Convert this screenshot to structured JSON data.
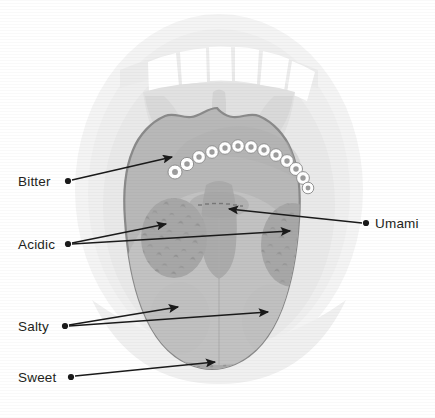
{
  "figure": {
    "background_color": "#ffffff"
  },
  "colors": {
    "page_background": "#ffffff",
    "lip_outer": "#f2f2f2",
    "mouth_inner": "#eaeaea",
    "teeth": "#ffffff",
    "palate": "#e2e2e2",
    "uvula": "#d8d8d8",
    "throat_shadow": "#d2d2d2",
    "tongue_body": "#b9b9b9",
    "tongue_outline": "#8a8a8a",
    "tongue_highlight": "#c6c6c6",
    "zone_shade": "#a8a8a8",
    "papilla_ring": "#ffffff",
    "papilla_center": "#9c9c9c",
    "papilla_stroke": "#8a8a8a",
    "leader_line": "#1a1a1a",
    "label_text": "#231f20"
  },
  "labels": [
    {
      "id": "bitter",
      "text": "Bitter",
      "text_x": 18,
      "text_y": 186,
      "anchor": "start",
      "dot_x": 68,
      "dot_y": 181,
      "arrows": [
        {
          "x1": 72,
          "y1": 180,
          "x2": 172,
          "y2": 157
        }
      ]
    },
    {
      "id": "acidic",
      "text": "Acidic",
      "text_x": 18,
      "text_y": 249,
      "anchor": "start",
      "dot_x": 68,
      "dot_y": 244,
      "arrows": [
        {
          "x1": 72,
          "y1": 243,
          "x2": 166,
          "y2": 224
        },
        {
          "x1": 72,
          "y1": 244,
          "x2": 290,
          "y2": 231
        }
      ]
    },
    {
      "id": "salty",
      "text": "Salty",
      "text_x": 18,
      "text_y": 331,
      "anchor": "start",
      "dot_x": 65,
      "dot_y": 326,
      "arrows": [
        {
          "x1": 69,
          "y1": 325,
          "x2": 178,
          "y2": 307
        },
        {
          "x1": 69,
          "y1": 326,
          "x2": 268,
          "y2": 312
        }
      ]
    },
    {
      "id": "sweet",
      "text": "Sweet",
      "text_x": 18,
      "text_y": 382,
      "anchor": "start",
      "dot_x": 71,
      "dot_y": 377,
      "arrows": [
        {
          "x1": 75,
          "y1": 376,
          "x2": 215,
          "y2": 362
        }
      ]
    },
    {
      "id": "umami",
      "text": "Umami",
      "text_x": 375,
      "text_y": 228,
      "anchor": "start",
      "dot_x": 366,
      "dot_y": 223,
      "arrows": [
        {
          "x1": 362,
          "y1": 223,
          "x2": 229,
          "y2": 209
        }
      ]
    }
  ],
  "papillae": {
    "count": 13,
    "description": "circumvallate papillae arc",
    "items": [
      {
        "cx": 175,
        "cy": 172,
        "r": 7.0
      },
      {
        "cx": 187,
        "cy": 164,
        "r": 6.6
      },
      {
        "cx": 199,
        "cy": 157,
        "r": 6.4
      },
      {
        "cx": 212,
        "cy": 152,
        "r": 6.3
      },
      {
        "cx": 225,
        "cy": 148,
        "r": 6.3
      },
      {
        "cx": 238,
        "cy": 146,
        "r": 6.3
      },
      {
        "cx": 251,
        "cy": 147,
        "r": 6.3
      },
      {
        "cx": 264,
        "cy": 150,
        "r": 6.3
      },
      {
        "cx": 276,
        "cy": 155,
        "r": 6.3
      },
      {
        "cx": 287,
        "cy": 161,
        "r": 6.4
      },
      {
        "cx": 296,
        "cy": 169,
        "r": 6.5
      },
      {
        "cx": 303,
        "cy": 178,
        "r": 6.4
      },
      {
        "cx": 308,
        "cy": 188,
        "r": 5.8
      }
    ]
  },
  "zones": [
    {
      "id": "bitter-zone",
      "name": "Bitter zone (back of tongue)"
    },
    {
      "id": "acidic-zone-left",
      "name": "Acidic zone, left lateral"
    },
    {
      "id": "acidic-zone-right",
      "name": "Acidic zone, right lateral"
    },
    {
      "id": "salty-zone-left",
      "name": "Salty zone, left lateral"
    },
    {
      "id": "salty-zone-right",
      "name": "Salty zone, right lateral"
    },
    {
      "id": "sweet-zone",
      "name": "Sweet zone (tip of tongue)"
    },
    {
      "id": "umami-zone",
      "name": "Umami zone (central back)"
    }
  ]
}
